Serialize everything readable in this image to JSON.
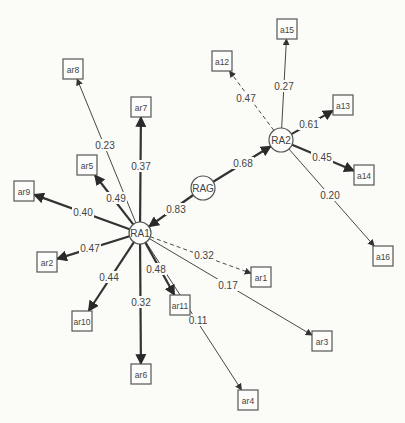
{
  "diagram": {
    "type": "path-diagram",
    "latent_nodes": [
      {
        "id": "RAG",
        "label": "RAG",
        "x": 203,
        "y": 188,
        "r": 12
      },
      {
        "id": "RA1",
        "label": "RA1",
        "x": 140,
        "y": 233,
        "r": 11
      },
      {
        "id": "RA2",
        "label": "RA2",
        "x": 281,
        "y": 140,
        "r": 12
      }
    ],
    "observed_nodes": [
      {
        "id": "ar1",
        "label": "ar1",
        "x": 261,
        "y": 277
      },
      {
        "id": "ar2",
        "label": "ar2",
        "x": 47,
        "y": 262
      },
      {
        "id": "ar3",
        "label": "ar3",
        "x": 322,
        "y": 341
      },
      {
        "id": "ar4",
        "label": "ar4",
        "x": 248,
        "y": 400
      },
      {
        "id": "ar5",
        "label": "ar5",
        "x": 87,
        "y": 165
      },
      {
        "id": "ar6",
        "label": "ar6",
        "x": 141,
        "y": 374
      },
      {
        "id": "ar7",
        "label": "ar7",
        "x": 141,
        "y": 107
      },
      {
        "id": "ar8",
        "label": "ar8",
        "x": 73,
        "y": 69
      },
      {
        "id": "ar9",
        "label": "ar9",
        "x": 24,
        "y": 191
      },
      {
        "id": "ar10",
        "label": "ar10",
        "x": 82,
        "y": 321
      },
      {
        "id": "ar11",
        "label": "ar11",
        "x": 180,
        "y": 305
      },
      {
        "id": "a12",
        "label": "a12",
        "x": 222,
        "y": 61
      },
      {
        "id": "a13",
        "label": "a13",
        "x": 343,
        "y": 105
      },
      {
        "id": "a14",
        "label": "a14",
        "x": 364,
        "y": 175
      },
      {
        "id": "a15",
        "label": "a15",
        "x": 287,
        "y": 29
      },
      {
        "id": "a16",
        "label": "a16",
        "x": 383,
        "y": 256
      }
    ],
    "edges": [
      {
        "from": "RAG",
        "to": "RA1",
        "weight": "0.83",
        "width": 2.4,
        "dashed": false,
        "lx": 176,
        "ly": 209
      },
      {
        "from": "RAG",
        "to": "RA2",
        "weight": "0.68",
        "width": 2.2,
        "dashed": false,
        "lx": 243,
        "ly": 163
      },
      {
        "from": "RA1",
        "to": "ar1",
        "weight": "0.32",
        "width": 0.9,
        "dashed": true,
        "lx": 204,
        "ly": 255
      },
      {
        "from": "RA1",
        "to": "ar2",
        "weight": "0.47",
        "width": 2.2,
        "dashed": false,
        "lx": 90,
        "ly": 248
      },
      {
        "from": "RA1",
        "to": "ar3",
        "weight": "0.17",
        "width": 0.9,
        "dashed": false,
        "lx": 228,
        "ly": 285
      },
      {
        "from": "RA1",
        "to": "ar4",
        "weight": "0.11",
        "width": 0.9,
        "dashed": false,
        "lx": 198,
        "ly": 320
      },
      {
        "from": "RA1",
        "to": "ar5",
        "weight": "0.49",
        "width": 2.2,
        "dashed": false,
        "lx": 116,
        "ly": 198
      },
      {
        "from": "RA1",
        "to": "ar6",
        "weight": "0.32",
        "width": 2.2,
        "dashed": false,
        "lx": 141,
        "ly": 302
      },
      {
        "from": "RA1",
        "to": "ar7",
        "weight": "0.37",
        "width": 2.2,
        "dashed": false,
        "lx": 141,
        "ly": 166
      },
      {
        "from": "RA1",
        "to": "ar8",
        "weight": "0.23",
        "width": 0.9,
        "dashed": false,
        "lx": 105,
        "ly": 145
      },
      {
        "from": "RA1",
        "to": "ar9",
        "weight": "0.40",
        "width": 2.2,
        "dashed": false,
        "lx": 83,
        "ly": 212
      },
      {
        "from": "RA1",
        "to": "ar10",
        "weight": "0.44",
        "width": 2.2,
        "dashed": false,
        "lx": 109,
        "ly": 277
      },
      {
        "from": "RA1",
        "to": "ar11",
        "weight": "0.48",
        "width": 2.2,
        "dashed": false,
        "lx": 156,
        "ly": 269
      },
      {
        "from": "RA2",
        "to": "a12",
        "weight": "0.47",
        "width": 0.9,
        "dashed": true,
        "lx": 246,
        "ly": 98
      },
      {
        "from": "RA2",
        "to": "a13",
        "weight": "0.61",
        "width": 2.2,
        "dashed": false,
        "lx": 309,
        "ly": 124
      },
      {
        "from": "RA2",
        "to": "a14",
        "weight": "0.45",
        "width": 2.2,
        "dashed": false,
        "lx": 322,
        "ly": 157
      },
      {
        "from": "RA2",
        "to": "a15",
        "weight": "0.27",
        "width": 0.9,
        "dashed": false,
        "lx": 284,
        "ly": 86
      },
      {
        "from": "RA2",
        "to": "a16",
        "weight": "0.20",
        "width": 0.9,
        "dashed": false,
        "lx": 330,
        "ly": 195
      }
    ]
  },
  "colors": {
    "line": "#333333",
    "box_stroke": "#555555",
    "text": "#444444",
    "background": "#fbfbf8"
  }
}
